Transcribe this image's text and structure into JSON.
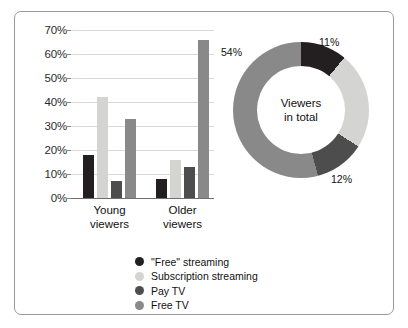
{
  "chart_data": [
    {
      "type": "bar",
      "title": "",
      "xlabel": "",
      "ylabel": "",
      "categories": [
        "Young viewers",
        "Older viewers"
      ],
      "category_lines": [
        [
          "Young",
          "viewers"
        ],
        [
          "Older",
          "viewers"
        ]
      ],
      "series": [
        {
          "name": "\"Free\" streaming",
          "color": "#231f20",
          "values": [
            18,
            8
          ]
        },
        {
          "name": "Subscription streaming",
          "color": "#d4d4d2",
          "values": [
            42,
            16
          ]
        },
        {
          "name": "Pay TV",
          "color": "#4d4d4d",
          "values": [
            7,
            13
          ]
        },
        {
          "name": "Free TV",
          "color": "#898989",
          "values": [
            33,
            66
          ]
        }
      ],
      "ylim": [
        0,
        70
      ],
      "ytick_values": [
        0,
        10,
        20,
        30,
        40,
        50,
        60,
        70
      ],
      "ytick_labels": [
        "0%",
        "10%",
        "20%",
        "30%",
        "40%",
        "50%",
        "60%",
        "70%"
      ],
      "grid": true,
      "legend_position": "bottom"
    },
    {
      "type": "pie",
      "variant": "donut",
      "title": "",
      "center_label_lines": [
        "Viewers",
        "in total"
      ],
      "start_angle_deg": 0,
      "direction": "clockwise",
      "slices": [
        {
          "name": "\"Free\" streaming",
          "value": 11,
          "label": "11%",
          "color": "#231f20",
          "label_shown": true
        },
        {
          "name": "Subscription streaming",
          "value": 23,
          "label": "23%",
          "color": "#d4d4d2",
          "label_shown": false
        },
        {
          "name": "Pay TV",
          "value": 12,
          "label": "12%",
          "color": "#4d4d4d",
          "label_shown": true
        },
        {
          "name": "Free TV",
          "value": 54,
          "label": "54%",
          "color": "#898989",
          "label_shown": true
        }
      ]
    }
  ],
  "legend": {
    "items": [
      {
        "label": "\"Free\" streaming",
        "color": "#231f20"
      },
      {
        "label": "Subscription streaming",
        "color": "#d4d4d2"
      },
      {
        "label": "Pay TV",
        "color": "#4d4d4d"
      },
      {
        "label": "Free TV",
        "color": "#898989"
      }
    ]
  },
  "style": {
    "background": "#ffffff",
    "border_color": "#9a9a9a",
    "gridline_color": "#d9d9d9",
    "axis_color": "#6e6e6e",
    "text_color": "#111111"
  }
}
